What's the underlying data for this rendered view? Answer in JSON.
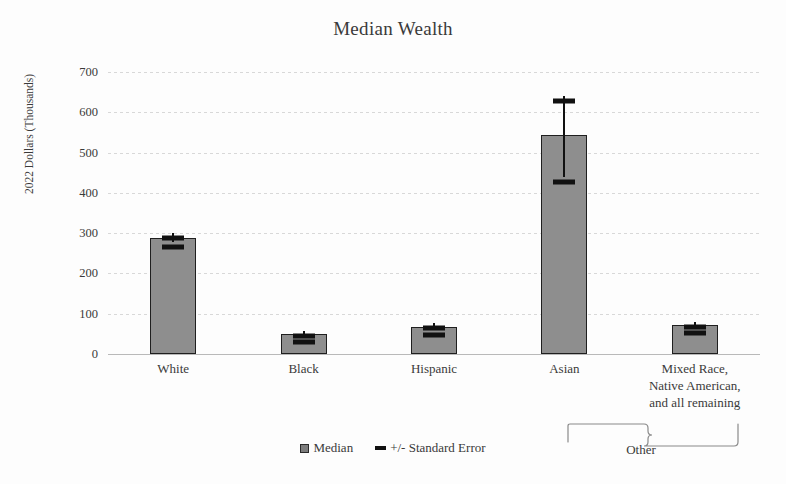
{
  "chart_data": {
    "type": "bar",
    "title": "Median Wealth",
    "xlabel": "",
    "ylabel": "2022 Dollars (Thousands)",
    "ylim": [
      0,
      700
    ],
    "ytick_values": [
      700,
      600,
      500,
      400,
      300,
      200,
      100,
      0
    ],
    "ytick_labels": [
      "700",
      "600",
      "500",
      "400",
      "300",
      "200",
      "100",
      "0"
    ],
    "grid": true,
    "legend_position": "bottom",
    "categories": [
      "White",
      "Black",
      "Hispanic",
      "Asian",
      "Mixed Race,\nNative American,\nand all remaining"
    ],
    "category_lines": [
      [
        "White"
      ],
      [
        "Black"
      ],
      [
        "Hispanic"
      ],
      [
        "Asian"
      ],
      [
        "Mixed Race,",
        "Native American,",
        "and all remaining"
      ]
    ],
    "series": [
      {
        "name": "Median",
        "values": [
          288,
          50,
          68,
          543,
          72
        ],
        "error_upper": [
          300,
          58,
          78,
          640,
          80
        ],
        "error_lower": [
          278,
          43,
          60,
          440,
          64
        ],
        "color": "#8e8e8e",
        "edge_color": "#1f1f1f"
      }
    ],
    "error_series_name": "+/- Standard Error",
    "error_color": "#111111",
    "annotations": [
      {
        "name": "other-brace",
        "text": "Other",
        "spans_category": "Mixed Race, Native American, and all remaining"
      }
    ]
  },
  "legend": {
    "items": [
      {
        "label": "Median",
        "marker": "square-swatch"
      },
      {
        "label": "+/- Standard Error",
        "marker": "dash-swatch"
      }
    ]
  }
}
